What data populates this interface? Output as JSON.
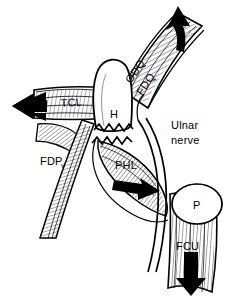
{
  "figure": {
    "type": "anatomical-line-drawing",
    "background_color": "#ffffff",
    "ink_color": "#000000",
    "labels": {
      "hamate": "H",
      "hamate_full": "Hook of hamate",
      "tcl": "TCL",
      "odq": "ODQ",
      "fdq": "FDQ",
      "fdp": "FDP",
      "fdp_subscript": "v",
      "phl": "PHL",
      "ulnar_nerve_line1": "Ulnar",
      "ulnar_nerve_line2": "nerve",
      "pisiform": "P",
      "fcu": "FCU"
    },
    "arrows": [
      {
        "name": "tcl-traction-arrow",
        "direction": "left",
        "color": "#000000"
      },
      {
        "name": "odq-fdq-traction-arrow",
        "direction": "up",
        "color": "#000000"
      },
      {
        "name": "phl-traction-arrow",
        "direction": "right",
        "color": "#000000"
      },
      {
        "name": "fcu-traction-arrow",
        "direction": "down",
        "color": "#000000"
      }
    ],
    "fracture": {
      "name": "zigzag-fracture-line",
      "style": "zigzag"
    }
  }
}
